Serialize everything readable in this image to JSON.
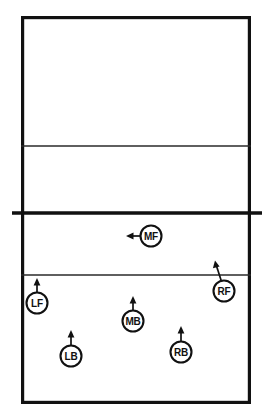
{
  "diagram": {
    "type": "court-diagram",
    "sport": "volleyball",
    "background_color": "#ffffff",
    "line_color": "#111111"
  },
  "court": {
    "outline": {
      "x": 21,
      "y": 16,
      "width": 230,
      "height": 388
    },
    "lines": [
      {
        "name": "far-attack-line",
        "y": 146,
        "x1": 21,
        "x2": 251,
        "weight": "thin"
      },
      {
        "name": "center-net-line",
        "y": 213,
        "x1": 12,
        "x2": 262,
        "weight": "thick"
      },
      {
        "name": "near-attack-line",
        "y": 275,
        "x1": 21,
        "x2": 251,
        "weight": "thin"
      }
    ]
  },
  "players": [
    {
      "id": "MF",
      "label": "MF",
      "position_name": "middle-front",
      "cx": 151,
      "cy": 236,
      "r": 10.5,
      "arrow": {
        "direction": "left",
        "x1": 140,
        "y1": 236,
        "x2": 127,
        "y2": 236
      }
    },
    {
      "id": "RF",
      "label": "RF",
      "position_name": "right-front",
      "cx": 224,
      "cy": 291,
      "r": 10.5,
      "arrow": {
        "direction": "up-right",
        "x1": 221,
        "y1": 281,
        "x2": 215,
        "y2": 262
      }
    },
    {
      "id": "LF",
      "label": "LF",
      "position_name": "left-front",
      "cx": 37,
      "cy": 303,
      "r": 10.5,
      "arrow": {
        "direction": "up",
        "x1": 37,
        "y1": 292,
        "x2": 37,
        "y2": 279
      }
    },
    {
      "id": "MB",
      "label": "MB",
      "position_name": "middle-back",
      "cx": 133,
      "cy": 321,
      "r": 10.5,
      "arrow": {
        "direction": "up",
        "x1": 133,
        "y1": 310,
        "x2": 133,
        "y2": 297
      }
    },
    {
      "id": "LB",
      "label": "LB",
      "position_name": "left-back",
      "cx": 71,
      "cy": 356,
      "r": 10.5,
      "arrow": {
        "direction": "up",
        "x1": 71,
        "y1": 345,
        "x2": 71,
        "y2": 331
      }
    },
    {
      "id": "RB",
      "label": "RB",
      "position_name": "right-back",
      "cx": 181,
      "cy": 352,
      "r": 10.5,
      "arrow": {
        "direction": "up",
        "x1": 181,
        "y1": 341,
        "x2": 181,
        "y2": 327
      }
    }
  ]
}
